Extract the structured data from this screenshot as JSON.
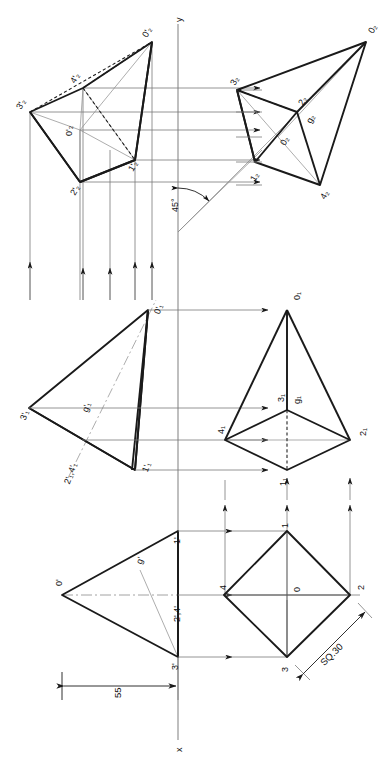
{
  "drawing": {
    "title": "Orthographic projection of a square pyramid",
    "axis_labels": {
      "vertical": "y",
      "horizontal": "x"
    },
    "angle_annotation": "45°",
    "dimensions": [
      {
        "name": "height",
        "value": "55"
      },
      {
        "name": "base-square",
        "value": "SQ.30"
      }
    ]
  },
  "views": {
    "front_view": {
      "name": "front-view",
      "labels": [
        {
          "id": "apex",
          "text": "0'"
        },
        {
          "id": "v1",
          "text": "1'"
        },
        {
          "id": "v24",
          "text": "2',4'"
        },
        {
          "id": "v3",
          "text": "3'"
        },
        {
          "id": "g",
          "text": "g'"
        }
      ]
    },
    "top_view": {
      "name": "top-view",
      "labels": [
        {
          "id": "center",
          "text": "0"
        },
        {
          "id": "v1",
          "text": "1"
        },
        {
          "id": "v2",
          "text": "2"
        },
        {
          "id": "v3",
          "text": "3"
        },
        {
          "id": "v4",
          "text": "4"
        }
      ]
    },
    "auxiliary_front_view": {
      "name": "auxiliary-front-view",
      "labels": [
        {
          "id": "apex",
          "text": "0'₁"
        },
        {
          "id": "v3",
          "text": "3'₁"
        },
        {
          "id": "v24",
          "text": "2'₁,4'₁"
        },
        {
          "id": "v1",
          "text": "1'₁"
        },
        {
          "id": "g",
          "text": "g'₁"
        }
      ]
    },
    "auxiliary_top_view": {
      "name": "auxiliary-top-view",
      "labels": [
        {
          "id": "apex",
          "text": "0₁"
        },
        {
          "id": "v1",
          "text": "1₁"
        },
        {
          "id": "v2",
          "text": "2₁"
        },
        {
          "id": "v3",
          "text": "3₁"
        },
        {
          "id": "v4",
          "text": "4₁"
        },
        {
          "id": "g",
          "text": "g₁"
        }
      ]
    },
    "second_auxiliary_front_view": {
      "name": "second-auxiliary-front-view",
      "labels": [
        {
          "id": "apex",
          "text": "0'₂"
        },
        {
          "id": "center",
          "text": "0'₂"
        },
        {
          "id": "v3",
          "text": "3'₂"
        },
        {
          "id": "v4",
          "text": "4'₂"
        },
        {
          "id": "v2",
          "text": "2'₂"
        },
        {
          "id": "v1",
          "text": "1'₂"
        }
      ]
    },
    "second_auxiliary_top_view": {
      "name": "second-auxiliary-top-view",
      "labels": [
        {
          "id": "apex",
          "text": "0₂"
        },
        {
          "id": "center",
          "text": "0₂"
        },
        {
          "id": "v1",
          "text": "1₂"
        },
        {
          "id": "v2",
          "text": "2₂"
        },
        {
          "id": "v3",
          "text": "3₂"
        },
        {
          "id": "v4",
          "text": "4₂"
        },
        {
          "id": "g",
          "text": "g₂"
        }
      ]
    }
  },
  "colors": {
    "object_line": "#1a1a1a",
    "thin_line": "#7a7a7a",
    "hidden_line": "#1a1a1a",
    "axis_line": "#8a8a8a",
    "background": "#ffffff"
  }
}
